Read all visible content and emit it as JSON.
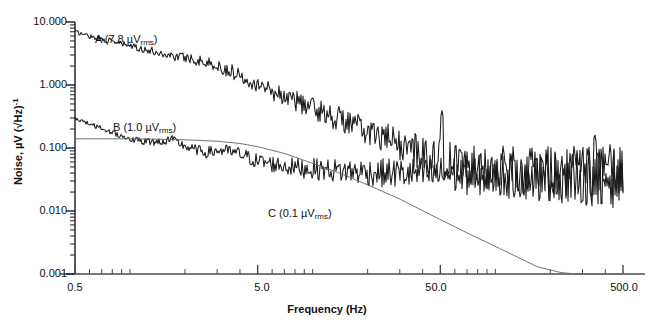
{
  "chart_data": {
    "type": "line",
    "title": "",
    "xlabel": "Frequency (Hz)",
    "ylabel": "Noise, µV (√Hz)⁻¹",
    "xscale": "log",
    "yscale": "log",
    "xlim": [
      0.5,
      500.0
    ],
    "ylim": [
      0.001,
      10.0
    ],
    "grid": false,
    "legend_position": "inline-annotations",
    "x_tick_labels": [
      "0.5",
      "5.0",
      "50.0",
      "500.0"
    ],
    "x_tick_values": [
      0.5,
      5.0,
      50.0,
      500.0
    ],
    "y_tick_labels": [
      "10.000",
      "1.000",
      "0.100",
      "0.010",
      "0.001"
    ],
    "y_tick_values": [
      10.0,
      1.0,
      0.1,
      0.01,
      0.001
    ],
    "annotations": [
      {
        "id": "A",
        "text": "A (7.8 µVrms)",
        "label_main": "A (7.8 µV",
        "label_sub": "rms",
        "label_tail": ")",
        "x": 95,
        "y": 33
      },
      {
        "id": "B",
        "text": "B (1.0 µVrms)",
        "label_main": "B (1.0 µV",
        "label_sub": "rms",
        "label_tail": ")",
        "x": 113,
        "y": 121
      },
      {
        "id": "C",
        "text": "C (0.1 µVrms)",
        "label_main": "C (0.1 µV",
        "label_sub": "rms",
        "label_tail": ")",
        "x": 268,
        "y": 207
      }
    ],
    "series": [
      {
        "name": "A (7.8 µVrms)",
        "color": "#1a1a1a",
        "style": "noisy-spectrum",
        "rms_uV": 7.8,
        "description": "1/f dominated input noise spectrum falling from ~7 µV/√Hz at 0.5 Hz to a ~0.04 µV/√Hz broadband floor above 100 Hz",
        "x": [
          0.5,
          0.6,
          0.75,
          0.9,
          1.1,
          1.4,
          1.7,
          2.1,
          2.6,
          3.2,
          4.0,
          5.0,
          6.2,
          7.7,
          9.5,
          12.0,
          15.0,
          18.5,
          23.0,
          28.0,
          35.0,
          44.0,
          55.0,
          68.0,
          85.0,
          105.0,
          130.0,
          165.0,
          205.0,
          255.0,
          320.0,
          400.0,
          500.0
        ],
        "y": [
          7.0,
          6.0,
          5.1,
          4.5,
          3.9,
          3.3,
          2.9,
          2.7,
          2.3,
          1.85,
          1.45,
          1.05,
          0.78,
          0.6,
          0.46,
          0.35,
          0.27,
          0.2,
          0.155,
          0.12,
          0.095,
          0.075,
          0.062,
          0.055,
          0.05,
          0.046,
          0.044,
          0.042,
          0.04,
          0.04,
          0.039,
          0.038,
          0.038
        ]
      },
      {
        "name": "B (1.0 µVrms)",
        "color": "#1a1a1a",
        "style": "noisy-spectrum",
        "rms_uV": 1.0,
        "description": "Lower-noise spectrum starting ~0.3 µV/√Hz at 0.5 Hz, plateau near 0.1 µV/√Hz from 1–10 Hz, settling to ~0.035 µV/√Hz floor",
        "x": [
          0.5,
          0.6,
          0.75,
          0.9,
          1.1,
          1.4,
          1.7,
          2.1,
          2.6,
          3.2,
          4.0,
          5.0,
          6.2,
          7.7,
          9.5,
          12.0,
          15.0,
          18.5,
          23.0,
          28.0,
          35.0,
          44.0,
          55.0,
          68.0,
          85.0,
          105.0,
          130.0,
          165.0,
          205.0,
          255.0,
          320.0,
          400.0,
          500.0
        ],
        "y": [
          0.3,
          0.24,
          0.19,
          0.155,
          0.13,
          0.125,
          0.135,
          0.1,
          0.085,
          0.092,
          0.08,
          0.062,
          0.055,
          0.05,
          0.047,
          0.045,
          0.043,
          0.042,
          0.04,
          0.04,
          0.039,
          0.038,
          0.038,
          0.037,
          0.037,
          0.036,
          0.036,
          0.035,
          0.035,
          0.035,
          0.034,
          0.034,
          0.034
        ]
      },
      {
        "name": "C (0.1 µVrms)",
        "color": "#6b6b6b",
        "style": "smooth-rolloff",
        "rms_uV": 0.1,
        "description": "Smooth band-limited response: flat at 0.14 µV/√Hz below 3 Hz then rolling off steeply, crossing 0.001 µV/√Hz near 280 Hz",
        "x": [
          0.5,
          0.8,
          1.2,
          2.0,
          3.0,
          4.0,
          5.0,
          7.0,
          10.0,
          14.0,
          20.0,
          30.0,
          45.0,
          70.0,
          110.0,
          170.0,
          230.0,
          280.0
        ],
        "y": [
          0.14,
          0.14,
          0.139,
          0.135,
          0.128,
          0.118,
          0.105,
          0.082,
          0.057,
          0.04,
          0.026,
          0.0155,
          0.0085,
          0.0045,
          0.0024,
          0.0013,
          0.00105,
          0.001
        ]
      }
    ],
    "spikes": [
      {
        "name": "mains-interference-spike",
        "frequency_hz": 51.0,
        "peak": 0.4
      },
      {
        "name": "secondary-interference-spike",
        "frequency_hz": 350.0,
        "peak": 0.17
      }
    ]
  }
}
